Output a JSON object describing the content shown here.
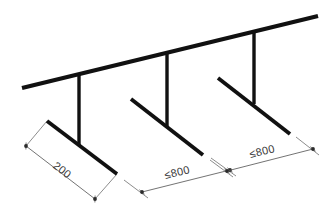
{
  "drawing": {
    "title": "Guardrail bracket spacing detail",
    "type": "axonometric-line-drawing",
    "background_color": "#ffffff",
    "line_color": "#111111",
    "dimension_color": "#5a5a5a",
    "text_color": "#3a3a3a",
    "canvas": {
      "width": 331,
      "height": 221
    }
  },
  "geometry": {
    "top_rail": {
      "name": "top-rail",
      "x1": 22,
      "y1": 88,
      "x2": 318,
      "y2": 16,
      "thickness": 4.2
    },
    "posts": [
      {
        "name": "post-left",
        "x1": 79,
        "y1": 75,
        "x2": 79,
        "y2": 146,
        "thickness": 3.4
      },
      {
        "name": "post-middle",
        "x1": 167,
        "y1": 53,
        "x2": 167,
        "y2": 126,
        "thickness": 3.4
      },
      {
        "name": "post-right",
        "x1": 254,
        "y1": 31,
        "x2": 254,
        "y2": 104,
        "thickness": 3.4
      }
    ],
    "base_members": [
      {
        "name": "base-left",
        "x1": 47,
        "y1": 121,
        "x2": 117,
        "y2": 174,
        "thickness": 3.8
      },
      {
        "name": "base-middle",
        "x1": 131,
        "y1": 99,
        "x2": 203,
        "y2": 155,
        "thickness": 3.8
      },
      {
        "name": "base-right",
        "x1": 218,
        "y1": 78,
        "x2": 290,
        "y2": 134,
        "thickness": 3.8
      }
    ]
  },
  "dimensions": [
    {
      "id": "dim-base-left",
      "label": "200",
      "description": "length of left base member",
      "line": {
        "x1": 26,
        "y1": 146,
        "x2": 95,
        "y2": 199
      },
      "text_pos": {
        "x": 60,
        "y": 173
      },
      "text_rotation": 37,
      "ext_lines": [
        {
          "x1": 47,
          "y1": 121,
          "x2": 26,
          "y2": 146
        },
        {
          "x1": 117,
          "y1": 174,
          "x2": 95,
          "y2": 199
        }
      ],
      "ticks": [
        {
          "x": 26,
          "y": 146,
          "angle": 37
        },
        {
          "x": 95,
          "y": 199,
          "angle": 37
        }
      ]
    },
    {
      "id": "dim-span-middle",
      "label": "≤800",
      "description": "clear spacing between left and middle post bases",
      "line": {
        "x1": 142,
        "y1": 192,
        "x2": 230,
        "y2": 170
      },
      "text_pos": {
        "x": 178,
        "y": 176
      },
      "text_rotation": -14,
      "ext_lines": [
        {
          "x1": 124,
          "y1": 180,
          "x2": 148,
          "y2": 198
        },
        {
          "x1": 211,
          "y1": 158,
          "x2": 236,
          "y2": 176
        }
      ],
      "ticks": [
        {
          "x": 142,
          "y": 192,
          "angle": -14
        },
        {
          "x": 230,
          "y": 170,
          "angle": -14
        }
      ]
    },
    {
      "id": "dim-span-right",
      "label": "≤800",
      "description": "clear spacing between middle and right post bases",
      "line": {
        "x1": 227,
        "y1": 171,
        "x2": 313,
        "y2": 149
      },
      "text_pos": {
        "x": 263,
        "y": 155
      },
      "text_rotation": -14,
      "ext_lines": [
        {
          "x1": 210,
          "y1": 160,
          "x2": 233,
          "y2": 177
        },
        {
          "x1": 296,
          "y1": 137,
          "x2": 319,
          "y2": 155
        }
      ],
      "ticks": [
        {
          "x": 227,
          "y": 171,
          "angle": -14
        },
        {
          "x": 313,
          "y": 149,
          "angle": -14
        }
      ]
    }
  ]
}
